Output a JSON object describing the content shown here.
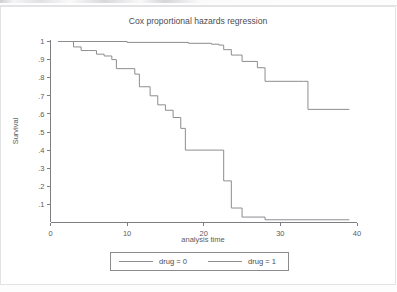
{
  "chart_data": {
    "type": "line",
    "subtype": "step-survival",
    "title": "Cox proportional hazards regression",
    "xlabel": "analysis time",
    "ylabel": "Survival",
    "xlim": [
      0,
      40
    ],
    "ylim": [
      0,
      1.02
    ],
    "grid": false,
    "legend_position": "bottom",
    "xticks": [
      0,
      10,
      20,
      30,
      40
    ],
    "xticklabels": [
      "0",
      "10",
      "20",
      "30",
      "40"
    ],
    "yticks": [
      0.1,
      0.2,
      0.3,
      0.4,
      0.5,
      0.6,
      0.7,
      0.8,
      0.9,
      1.0
    ],
    "yticklabels": [
      ".1",
      ".2",
      ".3",
      ".4",
      ".5",
      ".6",
      ".7",
      ".8",
      ".9",
      "1"
    ],
    "line_color": "#8d8d92",
    "series": [
      {
        "name": "drug = 0",
        "color": "#8d8d92",
        "x": [
          1.0,
          2.0,
          3.0,
          4.0,
          5.0,
          6.0,
          7.0,
          8.0,
          8.6,
          10.0,
          11.0,
          11.6,
          12.0,
          13.0,
          14.0,
          15.0,
          16.0,
          17.0,
          17.6,
          22.0,
          22.6,
          23.0,
          23.6,
          24.0,
          25.0,
          28.0,
          39.0
        ],
        "y": [
          1.0,
          1.0,
          0.97,
          0.95,
          0.95,
          0.93,
          0.92,
          0.9,
          0.85,
          0.85,
          0.82,
          0.75,
          0.75,
          0.7,
          0.65,
          0.62,
          0.58,
          0.52,
          0.4,
          0.4,
          0.23,
          0.23,
          0.08,
          0.08,
          0.03,
          0.015,
          0.015
        ]
      },
      {
        "name": "drug = 1",
        "color": "#8d8d92",
        "x": [
          1.0,
          2.0,
          10.0,
          18.0,
          21.0,
          22.0,
          22.6,
          23.0,
          23.6,
          24.0,
          25.0,
          27.0,
          28.0,
          33.0,
          33.6,
          39.0
        ],
        "y": [
          1.0,
          1.0,
          0.995,
          0.99,
          0.985,
          0.98,
          0.955,
          0.955,
          0.925,
          0.925,
          0.89,
          0.855,
          0.78,
          0.78,
          0.625,
          0.625
        ]
      }
    ]
  },
  "legend": {
    "entries": [
      {
        "label": "drug = 0"
      },
      {
        "label": "drug = 1"
      }
    ]
  }
}
